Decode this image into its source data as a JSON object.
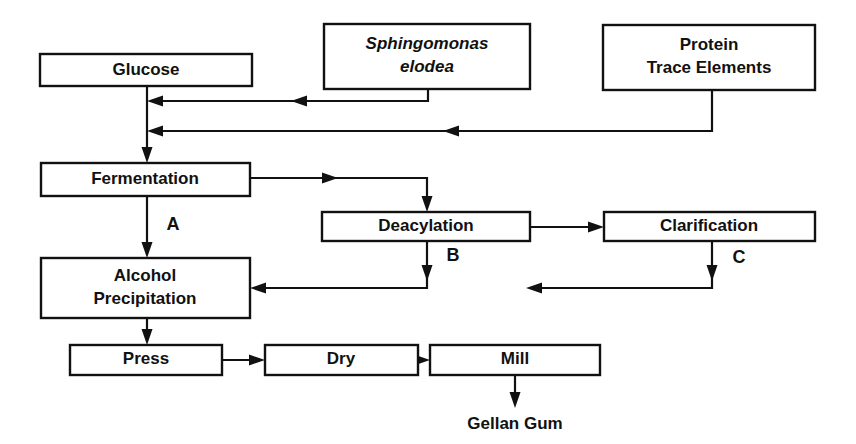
{
  "diagram": {
    "background_color": "#ffffff",
    "line_color": "#111111",
    "nodes": [
      {
        "id": "glucose",
        "label": "Glucose",
        "label_line2": "",
        "italic": false
      },
      {
        "id": "sphingomonas",
        "label": "Sphingomonas",
        "label_line2": "elodea",
        "italic": true
      },
      {
        "id": "protein",
        "label": "Protein",
        "label_line2": "Trace Elements",
        "italic": false
      },
      {
        "id": "fermentation",
        "label": "Fermentation",
        "label_line2": "",
        "italic": false
      },
      {
        "id": "deacylation",
        "label": "Deacylation",
        "label_line2": "",
        "italic": false
      },
      {
        "id": "clarification",
        "label": "Clarification",
        "label_line2": "",
        "italic": false
      },
      {
        "id": "alcohol",
        "label": "Alcohol",
        "label_line2": "Precipitation",
        "italic": false
      },
      {
        "id": "press",
        "label": "Press",
        "label_line2": "",
        "italic": false
      },
      {
        "id": "dry",
        "label": "Dry",
        "label_line2": "",
        "italic": false
      },
      {
        "id": "mill",
        "label": "Mill",
        "label_line2": "",
        "italic": false
      }
    ],
    "edge_labels": [
      {
        "id": "route-a",
        "label": "A"
      },
      {
        "id": "route-b",
        "label": "B"
      },
      {
        "id": "route-c",
        "label": "C"
      }
    ],
    "terminal": {
      "id": "gellan-gum",
      "label": "Gellan Gum"
    }
  }
}
